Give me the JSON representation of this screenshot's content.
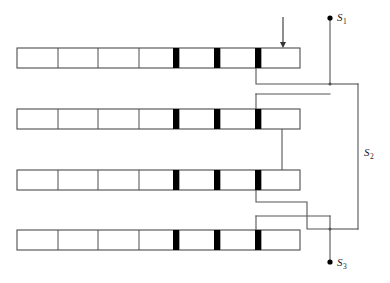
{
  "figure": {
    "background_color": "#ffffff",
    "line_color": "#555555",
    "outline_color": "#4d4d4d",
    "marker_color": "#000000",
    "terminal_color": "#000000"
  },
  "terminals": [
    {
      "id": "S1",
      "label": "S",
      "subscript": "1",
      "dot_x": 330,
      "dot_y": 18,
      "label_x": 337,
      "label_y": 21
    },
    {
      "id": "S2",
      "label": "S",
      "subscript": "2",
      "dot_x": null,
      "dot_y": null,
      "label_x": 364,
      "label_y": 156
    },
    {
      "id": "S3",
      "label": "S",
      "subscript": "3",
      "dot_x": 330,
      "dot_y": 262,
      "label_x": 337,
      "label_y": 266
    }
  ],
  "arrow": {
    "name": "input-arrow",
    "x": 283,
    "y_start": 17,
    "y_end": 48,
    "direction": "down"
  },
  "bars": [
    {
      "index": 1,
      "x": 17,
      "y": 48,
      "width": 283,
      "height": 20,
      "dividers": [
        58,
        98,
        139,
        179,
        220,
        261
      ],
      "markers": [
        {
          "x": 173,
          "width": 6
        },
        {
          "x": 214,
          "width": 6
        },
        {
          "x": 255,
          "width": 6
        }
      ]
    },
    {
      "index": 2,
      "x": 17,
      "y": 109,
      "width": 283,
      "height": 20,
      "dividers": [
        58,
        98,
        139,
        179,
        220,
        261
      ],
      "markers": [
        {
          "x": 173,
          "width": 6
        },
        {
          "x": 214,
          "width": 6
        },
        {
          "x": 255,
          "width": 6
        }
      ]
    },
    {
      "index": 3,
      "x": 17,
      "y": 170,
      "width": 283,
      "height": 20,
      "dividers": [
        58,
        98,
        139,
        179,
        220,
        261
      ],
      "markers": [
        {
          "x": 173,
          "width": 6
        },
        {
          "x": 214,
          "width": 6
        },
        {
          "x": 255,
          "width": 6
        }
      ]
    },
    {
      "index": 4,
      "x": 17,
      "y": 230,
      "width": 283,
      "height": 20,
      "dividers": [
        58,
        98,
        139,
        179,
        220,
        261
      ],
      "markers": [
        {
          "x": 173,
          "width": 6
        },
        {
          "x": 214,
          "width": 6
        },
        {
          "x": 255,
          "width": 6
        }
      ]
    }
  ],
  "wires": [
    {
      "name": "wire-bar1-to-s1-bus",
      "d": "M 256 68 L 256 84 L 330 84"
    },
    {
      "name": "wire-s1-lead",
      "d": "M 330 18 L 330 84"
    },
    {
      "name": "wire-s1-bus-to-right",
      "d": "M 330 84 L 358 84"
    },
    {
      "name": "wire-s2-right-vertical",
      "d": "M 358 84 L 358 229"
    },
    {
      "name": "wire-s2-to-bottom-junction",
      "d": "M 358 229 L 330 229"
    },
    {
      "name": "wire-bar2-top-lead",
      "d": "M 256 94 L 256 109"
    },
    {
      "name": "wire-bar2-top-horizontal",
      "d": "M 256 94 L 330 94"
    },
    {
      "name": "wire-bar2-to-bar3",
      "d": "M 282 129 L 282 170"
    },
    {
      "name": "wire-bar3-to-bus",
      "d": "M 256 190 L 256 202 L 307 202 L 307 229 L 330 229"
    },
    {
      "name": "wire-bar4-top-lead",
      "d": "M 256 216 L 256 230"
    },
    {
      "name": "wire-bar4-horizontal",
      "d": "M 256 216 L 330 216"
    },
    {
      "name": "wire-s3-lead",
      "d": "M 330 216 L 330 262"
    }
  ],
  "junctions": [
    {
      "name": "junction-s1-bus",
      "x": 330,
      "y": 84
    },
    {
      "name": "junction-s3-bus",
      "x": 330,
      "y": 229
    }
  ]
}
